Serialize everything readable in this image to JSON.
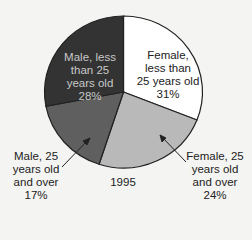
{
  "chart_data": {
    "type": "pie",
    "title": "1995",
    "start_angle_deg": 0,
    "direction": "clockwise",
    "slices": [
      {
        "label": "Female, less than 25 years old",
        "value": 31,
        "color": "#ffffff"
      },
      {
        "label": "Female, 25 years old and over",
        "value": 24,
        "color": "#b9b9b9"
      },
      {
        "label": "Male, 25 years old and over",
        "value": 17,
        "color": "#5f5f5f"
      },
      {
        "label": "Male, less than 25 years old",
        "value": 28,
        "color": "#333333"
      }
    ]
  },
  "labels": {
    "female_under25": "Female,\nless than\n25 years old\n31%",
    "female_over25": "Female, 25\nyears old\nand over\n24%",
    "male_over25": "Male, 25\nyears old\nand over\n17%",
    "male_under25": "Male, less\nthan 25\nyears old\n28%",
    "year": "1995"
  }
}
